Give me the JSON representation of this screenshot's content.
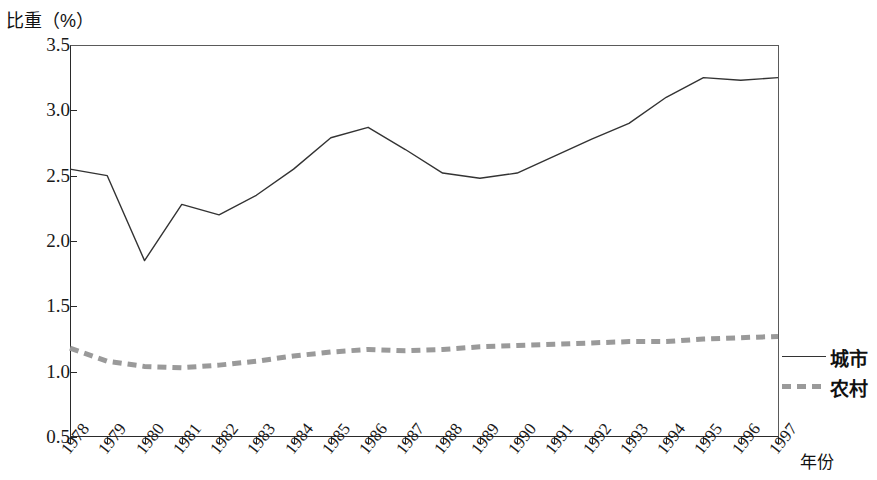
{
  "chart_data": {
    "type": "line",
    "title": "",
    "ylabel": "比重（%）",
    "xlabel": "年份",
    "grid": false,
    "legend_position": "right",
    "ylim": [
      0.5,
      3.5
    ],
    "yticks": [
      "3.5",
      "3.0",
      "2.5",
      "2.0",
      "1.5",
      "1.0",
      "0.5"
    ],
    "ytick_values": [
      3.5,
      3.0,
      2.5,
      2.0,
      1.5,
      1.0,
      0.5
    ],
    "categories": [
      "1978",
      "1979",
      "1980",
      "1981",
      "1982",
      "1983",
      "1984",
      "1985",
      "1986",
      "1987",
      "1988",
      "1989",
      "1990",
      "1991",
      "1992",
      "1993",
      "1994",
      "1995",
      "1996",
      "1997"
    ],
    "x": [
      1978,
      1979,
      1980,
      1981,
      1982,
      1983,
      1984,
      1985,
      1986,
      1987,
      1988,
      1989,
      1990,
      1991,
      1992,
      1993,
      1994,
      1995,
      1996,
      1997
    ],
    "series": [
      {
        "name": "城市",
        "style": "solid",
        "color": "#333333",
        "values": [
          2.55,
          2.5,
          1.85,
          2.28,
          2.2,
          2.35,
          2.55,
          2.79,
          2.87,
          2.7,
          2.52,
          2.48,
          2.52,
          2.65,
          2.78,
          2.9,
          3.1,
          3.25,
          3.23,
          3.25
        ]
      },
      {
        "name": "农村",
        "style": "dashed",
        "color": "#9a9a9a",
        "values": [
          1.18,
          1.08,
          1.04,
          1.03,
          1.05,
          1.08,
          1.12,
          1.15,
          1.17,
          1.16,
          1.17,
          1.19,
          1.2,
          1.21,
          1.22,
          1.23,
          1.23,
          1.25,
          1.26,
          1.27
        ]
      }
    ]
  },
  "legend": {
    "items": [
      {
        "label": "城市",
        "style": "solid"
      },
      {
        "label": "农村",
        "style": "dashed"
      }
    ]
  }
}
